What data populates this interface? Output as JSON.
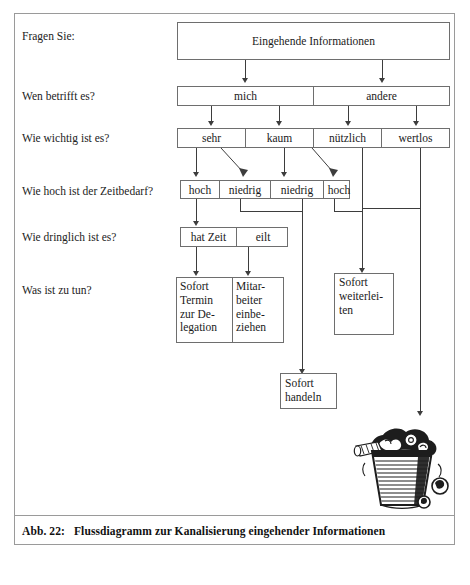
{
  "figure": {
    "caption_number": "Abb. 22:",
    "caption_text": "Flussdiagramm zur Kanalisierung eingehender Informationen"
  },
  "row_labels": {
    "r1": "Fragen Sie:",
    "r2": "Wen betrifft es?",
    "r3": "Wie wichtig ist es?",
    "r4": "Wie hoch ist der Zeitbedarf?",
    "r5": "Wie dringlich ist es?",
    "r6": "Was ist zu tun?"
  },
  "nodes": {
    "root": "Eingehende Informationen",
    "affected": [
      "mich",
      "andere"
    ],
    "importance": [
      "sehr",
      "kaum",
      "nützlich",
      "wertlos"
    ],
    "time_effort": [
      "hoch",
      "niedrig",
      "niedrig",
      "hoch"
    ],
    "urgency": [
      "hat Zeit",
      "eilt"
    ],
    "actions": {
      "delegate": "Sofort Termin zur De- legation",
      "delegate_lines": [
        "Sofort",
        "Termin",
        "zur De-",
        "legation"
      ],
      "involve": "Mitar- beiter einbe- ziehen",
      "involve_lines": [
        "Mitar-",
        "beiter",
        "einbe-",
        "ziehen"
      ],
      "forward": "Sofort weiterlei- ten",
      "forward_lines": [
        "Sofort",
        "weiterlei-",
        "ten"
      ],
      "act_now": "Sofort handeln",
      "act_now_lines": [
        "Sofort",
        "handeln"
      ],
      "discard_icon": "wastebasket-icon"
    }
  },
  "colors": {
    "ink": "#1a1a1a",
    "line": "#3d3d3d",
    "box_border": "#6e6e6e",
    "frame": "#9a9a9a",
    "paper": "#ffffff"
  }
}
